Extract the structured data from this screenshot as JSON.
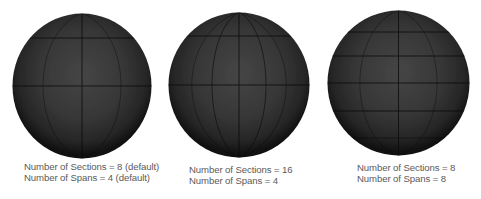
{
  "figure": {
    "background": "#ffffff",
    "sphere_colors": {
      "center": "#454545",
      "mid": "#2e2e2e",
      "edge": "#141414",
      "grid_line": "#0a0a0a"
    },
    "panels": [
      {
        "id": "sphere-sections-8-spans-4",
        "sections": 8,
        "spans": 4,
        "caption_line1": "Number of Sections = 8 (default)",
        "caption_line2": "Number of Spans = 4 (default)"
      },
      {
        "id": "sphere-sections-16-spans-4",
        "sections": 16,
        "spans": 4,
        "caption_line1": "Number of Sections = 16",
        "caption_line2": "Number of Spans = 4"
      },
      {
        "id": "sphere-sections-8-spans-8",
        "sections": 8,
        "spans": 8,
        "caption_line1": "Number of Sections = 8",
        "caption_line2": "Number of Spans = 8"
      }
    ]
  }
}
